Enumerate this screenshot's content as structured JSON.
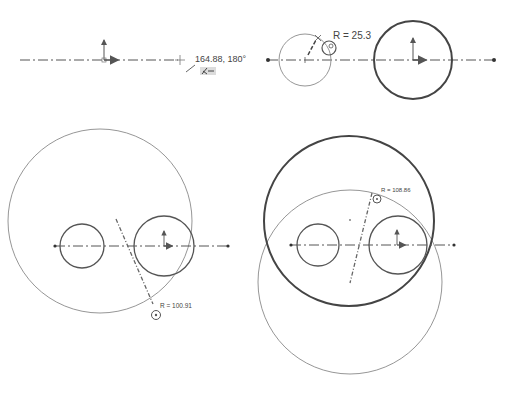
{
  "panels": [
    {
      "id": "step-1-centerline",
      "cursor_readout": "164.88, 180°",
      "cursor_icon": "sketch-line-cursor-icon"
    },
    {
      "id": "step-2-circles",
      "radius_label": "R = 25.3",
      "cursor_icon": "circle-cursor-icon"
    },
    {
      "id": "step-3-enclosing-circle",
      "radius_label": "R = 100.91",
      "cursor_icon": "circle-cursor-icon"
    },
    {
      "id": "step-4-second-circle",
      "radius_label": "R = 108.86",
      "cursor_icon": "circle-cursor-icon"
    }
  ],
  "colors": {
    "background": "#ffffff",
    "line": "#555555",
    "thin_line": "#8a8a8a",
    "text": "#444444"
  }
}
